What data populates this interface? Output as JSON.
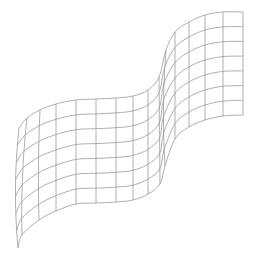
{
  "figure": {
    "line_color": "#9a9a9a",
    "background_color": "#ffffff",
    "grid": {
      "columns": 16,
      "rows": 8
    }
  }
}
